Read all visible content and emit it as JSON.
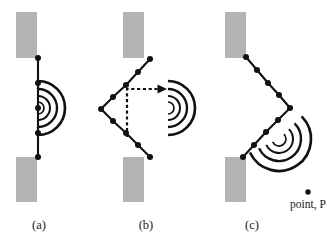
{
  "figure": {
    "width": 327,
    "height": 249,
    "background_color": "#ffffff",
    "ink_color": "#111111",
    "barrier_color": "#b3b3b3"
  },
  "labels": {
    "panel_a": "(a)",
    "panel_b": "(b)",
    "panel_c": "(c)",
    "point_p": "point, P"
  },
  "chart_data": {
    "type": "diagram",
    "panels": [
      {
        "id": "a",
        "caption": "(a)",
        "barriers": [
          {
            "x": 16,
            "y": 12,
            "w": 21,
            "h": 46
          },
          {
            "x": 16,
            "y": 157,
            "w": 21,
            "h": 45
          }
        ],
        "chain_points": [
          {
            "x": 38,
            "y": 58
          },
          {
            "x": 38,
            "y": 83
          },
          {
            "x": 38,
            "y": 108
          },
          {
            "x": 38,
            "y": 133
          },
          {
            "x": 38,
            "y": 157
          }
        ],
        "wave_center": {
          "x": 38,
          "y": 108
        },
        "wave_radii": [
          6,
          12,
          19,
          27
        ],
        "wave_start_angle_deg": -90,
        "wave_sweep_deg": 180,
        "dashed_arrow": null
      },
      {
        "id": "b",
        "caption": "(b)",
        "barriers": [
          {
            "x": 123,
            "y": 12,
            "w": 21,
            "h": 46
          },
          {
            "x": 123,
            "y": 157,
            "w": 21,
            "h": 45
          }
        ],
        "chain_points": [
          {
            "x": 150,
            "y": 59
          },
          {
            "x": 138,
            "y": 72
          },
          {
            "x": 126,
            "y": 85
          },
          {
            "x": 113,
            "y": 97
          },
          {
            "x": 101,
            "y": 109
          },
          {
            "x": 113,
            "y": 121
          },
          {
            "x": 126,
            "y": 133
          },
          {
            "x": 138,
            "y": 145
          },
          {
            "x": 150,
            "y": 157
          }
        ],
        "wave_center": {
          "x": 168,
          "y": 108
        },
        "wave_radii": [
          6,
          12,
          19,
          27
        ],
        "wave_start_angle_deg": -90,
        "wave_sweep_deg": 180,
        "dashed_arrow": {
          "points": [
            {
              "x": 127,
              "y": 137
            },
            {
              "x": 127,
              "y": 89
            },
            {
              "x": 159,
              "y": 89
            }
          ],
          "arrow_tip": {
            "x": 167,
            "y": 89
          },
          "direction": "right"
        }
      },
      {
        "id": "c",
        "caption": "(c)",
        "barriers": [
          {
            "x": 225,
            "y": 12,
            "w": 21,
            "h": 46
          },
          {
            "x": 225,
            "y": 157,
            "w": 21,
            "h": 45
          }
        ],
        "chain_points": [
          {
            "x": 246,
            "y": 57
          },
          {
            "x": 257,
            "y": 70
          },
          {
            "x": 268,
            "y": 83
          },
          {
            "x": 279,
            "y": 95
          },
          {
            "x": 290,
            "y": 108
          },
          {
            "x": 278,
            "y": 120
          },
          {
            "x": 266,
            "y": 132
          },
          {
            "x": 254,
            "y": 145
          },
          {
            "x": 243,
            "y": 157
          }
        ],
        "wave_center": {
          "x": 279,
          "y": 139
        },
        "wave_radii": [
          7,
          14,
          22,
          32
        ],
        "wave_start_angle_deg": -45,
        "wave_sweep_deg": 200,
        "dashed_arrow": null,
        "marked_point": {
          "x": 308,
          "y": 192,
          "label": "point, P"
        }
      }
    ]
  }
}
